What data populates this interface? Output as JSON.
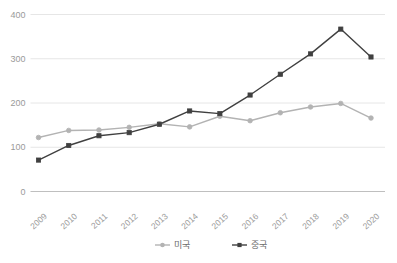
{
  "chart_data": {
    "type": "line",
    "title": "",
    "subtitle": "",
    "xlabel": "",
    "ylabel": "",
    "categories": [
      "2009",
      "2010",
      "2011",
      "2012",
      "2013",
      "2014",
      "2015",
      "2016",
      "2017",
      "2018",
      "2019",
      "2020"
    ],
    "series": [
      {
        "name": "미국",
        "color": "#b3b3b3",
        "marker": "circle",
        "values": [
          122,
          138,
          139,
          145,
          153,
          146,
          170,
          160,
          178,
          191,
          199,
          166
        ]
      },
      {
        "name": "중국",
        "color": "#404040",
        "marker": "square",
        "values": [
          71,
          104,
          126,
          133,
          152,
          182,
          176,
          218,
          265,
          311,
          367,
          304
        ]
      }
    ],
    "yticks": [
      0,
      100,
      200,
      300,
      400
    ],
    "ytick_labels": [
      "0",
      "100",
      "200",
      "300",
      "400"
    ],
    "ylim": [
      0,
      400
    ],
    "grid": true,
    "grid_color": "#e6e6e6",
    "axis_color": "#bfbfbf",
    "legend_position": "bottom"
  },
  "legend": {
    "items": [
      {
        "label": "미국",
        "color": "#b3b3b3"
      },
      {
        "label": "중국",
        "color": "#404040"
      }
    ]
  }
}
